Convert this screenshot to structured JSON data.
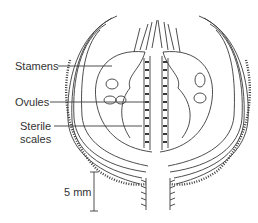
{
  "diagram": {
    "labels": {
      "stamens": "Stamens",
      "ovules": "Ovules",
      "sterile_line1": "Sterile",
      "sterile_line2": "scales"
    },
    "scale_bar": {
      "label": "5 mm"
    },
    "colors": {
      "line": "#3a3a3a",
      "background": "#ffffff"
    }
  }
}
